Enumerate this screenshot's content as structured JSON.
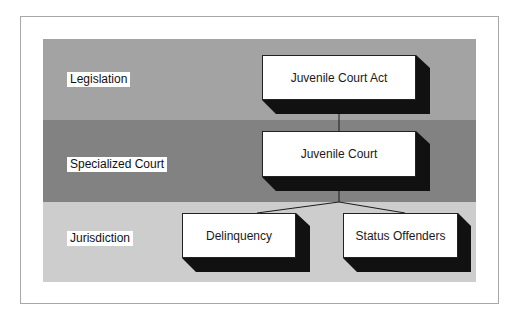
{
  "diagram": {
    "type": "hierarchy",
    "colors": {
      "legislation_band": "#a3a3a3",
      "court_band": "#828282",
      "jurisdiction_band": "#cdcdcd",
      "box_fill": "#ffffff",
      "box_shadow": "#111111",
      "frame_border": "#a8a8a8"
    },
    "bands": [
      {
        "id": "legislation",
        "label": "Legislation"
      },
      {
        "id": "specialized_court",
        "label": "Specialized Court"
      },
      {
        "id": "jurisdiction",
        "label": "Jurisdiction"
      }
    ],
    "nodes": [
      {
        "id": "act",
        "label": "Juvenile Court Act",
        "band": "legislation"
      },
      {
        "id": "court",
        "label": "Juvenile Court",
        "band": "specialized_court"
      },
      {
        "id": "delinquency",
        "label": "Delinquency",
        "band": "jurisdiction"
      },
      {
        "id": "status",
        "label": "Status Offenders",
        "band": "jurisdiction"
      }
    ],
    "edges": [
      {
        "from": "Juvenile Court Act",
        "to": "Juvenile Court"
      },
      {
        "from": "Juvenile Court",
        "to": "Delinquency"
      },
      {
        "from": "Juvenile Court",
        "to": "Status Offenders"
      }
    ]
  }
}
